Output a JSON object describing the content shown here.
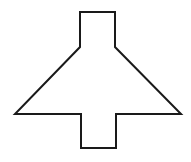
{
  "diagram": {
    "stroke_color": "#1a1a1a",
    "fill_color": "#ffffff",
    "stroke_width": 2,
    "vertices": [
      [
        80,
        12
      ],
      [
        115,
        12
      ],
      [
        115,
        47
      ],
      [
        181,
        114
      ],
      [
        116,
        114
      ],
      [
        116,
        148
      ],
      [
        81,
        148
      ],
      [
        81,
        114
      ],
      [
        15,
        114
      ],
      [
        80,
        47
      ]
    ],
    "points": "80,12 115,12 115,47 181,114 116,114 116,148 81,148 81,114 15,114 80,47"
  }
}
